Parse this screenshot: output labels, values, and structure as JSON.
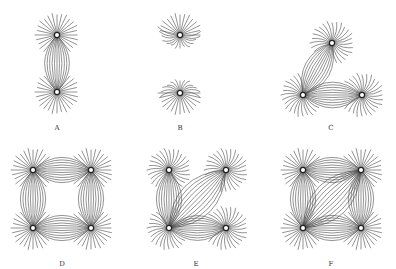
{
  "figure": {
    "colors": {
      "line": "#4a4a4a",
      "pole_ring": "#222222",
      "pole_fill": "#ffffff",
      "background": "#ffffff"
    },
    "panels": [
      {
        "id": "A",
        "label": "A",
        "label_pos": [
          57,
          124
        ],
        "poles": [
          [
            57,
            35
          ],
          [
            57,
            92
          ]
        ],
        "mode": "attract",
        "links": [
          [
            0,
            1
          ]
        ]
      },
      {
        "id": "B",
        "label": "B",
        "label_pos": [
          180,
          124
        ],
        "poles": [
          [
            180,
            35
          ],
          [
            180,
            93
          ]
        ],
        "mode": "repel",
        "links": [
          [
            0,
            1
          ]
        ]
      },
      {
        "id": "C",
        "label": "C",
        "label_pos": [
          331,
          124
        ],
        "poles": [
          [
            332,
            43
          ],
          [
            303,
            95
          ],
          [
            362,
            95
          ]
        ],
        "mode": "mixed",
        "links": [
          [
            0,
            1
          ],
          [
            1,
            2
          ]
        ]
      },
      {
        "id": "D",
        "label": "D",
        "label_pos": [
          62,
          260
        ],
        "poles": [
          [
            33,
            170
          ],
          [
            91,
            170
          ],
          [
            33,
            228
          ],
          [
            91,
            228
          ]
        ],
        "mode": "attract",
        "links": [
          [
            0,
            1
          ],
          [
            0,
            2
          ],
          [
            1,
            3
          ],
          [
            2,
            3
          ]
        ]
      },
      {
        "id": "E",
        "label": "E",
        "label_pos": [
          196,
          260
        ],
        "poles": [
          [
            169,
            170
          ],
          [
            226,
            170
          ],
          [
            169,
            228
          ],
          [
            226,
            228
          ]
        ],
        "mode": "mixed",
        "links": [
          [
            0,
            2
          ],
          [
            1,
            2
          ],
          [
            2,
            3
          ]
        ]
      },
      {
        "id": "F",
        "label": "F",
        "label_pos": [
          331,
          260
        ],
        "poles": [
          [
            303,
            170
          ],
          [
            361,
            170
          ],
          [
            303,
            228
          ],
          [
            361,
            228
          ]
        ],
        "mode": "attract",
        "links": [
          [
            0,
            1
          ],
          [
            0,
            2
          ],
          [
            1,
            3
          ],
          [
            2,
            3
          ],
          [
            1,
            2
          ]
        ]
      }
    ]
  }
}
